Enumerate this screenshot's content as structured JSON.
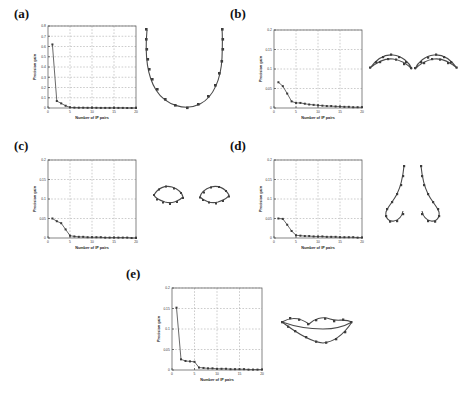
{
  "figure": {
    "background_color": "#ffffff",
    "line_color": "#444444",
    "grid_color": "#999999"
  },
  "panels": [
    {
      "id": "a",
      "label": "(a)",
      "shape_name": "face-contour-jawline",
      "chart_data": {
        "type": "line",
        "title": "",
        "xlabel": "Number of IP pairs",
        "ylabel": "Precision gain",
        "xlim": [
          0,
          20
        ],
        "ylim": [
          0,
          0.8
        ],
        "xticks": [
          0,
          5,
          10,
          15,
          20
        ],
        "yticks": [
          0,
          0.1,
          0.2,
          0.3,
          0.4,
          0.5,
          0.6,
          0.7,
          0.8
        ],
        "ytick_labels": [
          "0",
          "0.1",
          "0.2",
          "0.3",
          "0.4",
          "0.5",
          "0.6",
          "0.7",
          "0.8"
        ],
        "xtick_labels": [
          "0",
          "5",
          "10",
          "15",
          "20"
        ],
        "grid": true,
        "x": [
          1,
          2,
          3,
          4,
          5,
          6,
          7,
          8,
          9,
          10,
          11,
          12,
          13,
          14,
          15,
          16,
          17,
          18,
          19,
          20
        ],
        "values": [
          0.62,
          0.068,
          0.045,
          0.022,
          0.006,
          0.004,
          0.003,
          0.003,
          0.002,
          0.002,
          0.002,
          0.001,
          0.001,
          0.001,
          0.001,
          0.001,
          0.001,
          0.0,
          0.0,
          0.0
        ]
      }
    },
    {
      "id": "b",
      "label": "(b)",
      "shape_name": "eyebrows",
      "chart_data": {
        "type": "line",
        "title": "",
        "xlabel": "Number of IP pairs",
        "ylabel": "Precision gain",
        "xlim": [
          0,
          20
        ],
        "ylim": [
          0,
          0.2
        ],
        "xticks": [
          0,
          5,
          10,
          15,
          20
        ],
        "yticks": [
          0,
          0.05,
          0.1,
          0.15,
          0.2
        ],
        "ytick_labels": [
          "0",
          "0.05",
          "0.1",
          "0.15",
          "0.2"
        ],
        "xtick_labels": [
          "0",
          "5",
          "10",
          "15",
          "20"
        ],
        "grid": true,
        "x": [
          1,
          2,
          3,
          4,
          5,
          6,
          7,
          8,
          9,
          10,
          11,
          12,
          13,
          14,
          15,
          16,
          17,
          18,
          19,
          20
        ],
        "values": [
          0.066,
          0.056,
          0.037,
          0.017,
          0.013,
          0.013,
          0.011,
          0.009,
          0.008,
          0.007,
          0.006,
          0.005,
          0.005,
          0.004,
          0.004,
          0.003,
          0.003,
          0.002,
          0.002,
          0.002
        ]
      }
    },
    {
      "id": "c",
      "label": "(c)",
      "shape_name": "eyes",
      "chart_data": {
        "type": "line",
        "title": "",
        "xlabel": "Number of IP pairs",
        "ylabel": "Precision gain",
        "xlim": [
          0,
          20
        ],
        "ylim": [
          0,
          0.2
        ],
        "xticks": [
          0,
          5,
          10,
          15,
          20
        ],
        "yticks": [
          0,
          0.05,
          0.1,
          0.15,
          0.2
        ],
        "ytick_labels": [
          "0",
          "0.05",
          "0.1",
          "0.15",
          "0.2"
        ],
        "xtick_labels": [
          "0",
          "5",
          "10",
          "15",
          "20"
        ],
        "grid": true,
        "x": [
          1,
          2,
          3,
          4,
          5,
          6,
          7,
          8,
          9,
          10,
          11,
          12,
          13,
          14,
          15,
          16,
          17,
          18,
          19,
          20
        ],
        "values": [
          0.05,
          0.043,
          0.038,
          0.022,
          0.006,
          0.004,
          0.003,
          0.003,
          0.002,
          0.002,
          0.002,
          0.002,
          0.001,
          0.001,
          0.001,
          0.001,
          0.001,
          0.001,
          0.0,
          0.0
        ]
      }
    },
    {
      "id": "d",
      "label": "(d)",
      "shape_name": "nose",
      "chart_data": {
        "type": "line",
        "title": "",
        "xlabel": "Number of IP pairs",
        "ylabel": "Precision gain",
        "xlim": [
          0,
          20
        ],
        "ylim": [
          0,
          0.2
        ],
        "xticks": [
          0,
          5,
          10,
          15,
          20
        ],
        "yticks": [
          0,
          0.05,
          0.1,
          0.15,
          0.2
        ],
        "ytick_labels": [
          "0",
          "0.05",
          "0.1",
          "0.15",
          "0.2"
        ],
        "xtick_labels": [
          "0",
          "5",
          "10",
          "15",
          "20"
        ],
        "grid": true,
        "x": [
          1,
          2,
          3,
          4,
          5,
          6,
          7,
          8,
          9,
          10,
          11,
          12,
          13,
          14,
          15,
          16,
          17,
          18,
          19,
          20
        ],
        "values": [
          0.05,
          0.049,
          0.034,
          0.018,
          0.007,
          0.006,
          0.005,
          0.005,
          0.004,
          0.004,
          0.004,
          0.003,
          0.003,
          0.003,
          0.002,
          0.002,
          0.002,
          0.002,
          0.001,
          0.001
        ]
      }
    },
    {
      "id": "e",
      "label": "(e)",
      "shape_name": "mouth",
      "chart_data": {
        "type": "line",
        "title": "",
        "xlabel": "Number of IP pairs",
        "ylabel": "Precision gain",
        "xlim": [
          0,
          20
        ],
        "ylim": [
          0,
          0.2
        ],
        "xticks": [
          0,
          5,
          10,
          15,
          20
        ],
        "yticks": [
          0,
          0.05,
          0.1,
          0.15,
          0.2
        ],
        "ytick_labels": [
          "0",
          "0.05",
          "0.1",
          "0.15",
          "0.2"
        ],
        "xtick_labels": [
          "0",
          "5",
          "10",
          "15",
          "20"
        ],
        "grid": true,
        "x": [
          1,
          2,
          3,
          4,
          5,
          6,
          7,
          8,
          9,
          10,
          11,
          12,
          13,
          14,
          15,
          16,
          17,
          18,
          19,
          20
        ],
        "values": [
          0.152,
          0.026,
          0.022,
          0.021,
          0.02,
          0.006,
          0.005,
          0.004,
          0.004,
          0.003,
          0.003,
          0.003,
          0.002,
          0.002,
          0.002,
          0.002,
          0.001,
          0.001,
          0.001,
          0.001
        ]
      }
    }
  ]
}
